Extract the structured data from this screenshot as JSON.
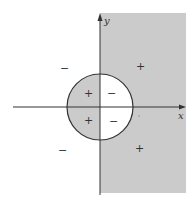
{
  "diagram": {
    "type": "sign-chart-region",
    "colors": {
      "background": "#ffffff",
      "shade": "#cbcbcb",
      "stroke": "#333333"
    },
    "axes": {
      "x_label": "x",
      "y_label": "y"
    },
    "shaded_regions": [
      "half-plane x > 0 outside circle",
      "disk interior with x < 0"
    ],
    "outside_signs": [
      {
        "label": "−",
        "position": "upper-left"
      },
      {
        "label": "+",
        "position": "upper-right"
      },
      {
        "label": "−",
        "position": "lower-left"
      },
      {
        "label": "+",
        "position": "lower-right"
      }
    ],
    "inside_signs": [
      {
        "label": "+",
        "position": "circle-upper-left"
      },
      {
        "label": "−",
        "position": "circle-upper-right"
      },
      {
        "label": "+",
        "position": "circle-lower-left"
      },
      {
        "label": "−",
        "position": "circle-lower-right"
      }
    ]
  }
}
